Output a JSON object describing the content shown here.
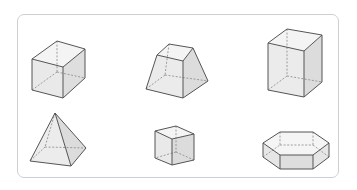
{
  "figure": {
    "colors": {
      "frame_border": "#cfcfcf",
      "edge": "#555555",
      "hidden_edge": "#888888",
      "face_light": "#f2f2f2",
      "face_mid": "#e6e6e6",
      "face_dark": "#d9d9d9"
    },
    "shapes": [
      {
        "name": "cube",
        "row": 1,
        "col": 1
      },
      {
        "name": "square-frustum",
        "row": 1,
        "col": 2
      },
      {
        "name": "rectangular-prism",
        "row": 1,
        "col": 3
      },
      {
        "name": "square-pyramid",
        "row": 2,
        "col": 1
      },
      {
        "name": "small-cube",
        "row": 2,
        "col": 2
      },
      {
        "name": "hexagonal-prism",
        "row": 2,
        "col": 3
      }
    ]
  }
}
